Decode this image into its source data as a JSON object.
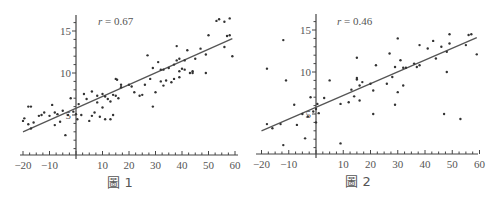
{
  "chart_data": [
    {
      "type": "scatter",
      "title": "",
      "caption": "圖 1",
      "annotation": "r = 0.67",
      "annotation_var": "r",
      "annotation_value": "= 0.67",
      "xlabel": "",
      "ylabel": "",
      "xlim": [
        -21,
        61
      ],
      "ylim": [
        0,
        17
      ],
      "x_ticks": [
        -20,
        -10,
        10,
        20,
        30,
        40,
        50,
        60
      ],
      "x_tick_labels": [
        "−20",
        "−10",
        "10",
        "20",
        "30",
        "40",
        "50",
        "60"
      ],
      "y_ticks": [
        5,
        10,
        15
      ],
      "y_tick_labels": [
        "5",
        "10",
        "15"
      ],
      "grid": false,
      "fit_line": {
        "x": [
          -20,
          59
        ],
        "y": [
          3.0,
          14.1
        ]
      },
      "points": [
        [
          -20,
          4.3
        ],
        [
          -19.5,
          4.6
        ],
        [
          -18,
          6.0
        ],
        [
          -17,
          6.0
        ],
        [
          -18,
          3.9
        ],
        [
          -17,
          3.4
        ],
        [
          -16,
          4.1
        ],
        [
          -14,
          4.9
        ],
        [
          -13,
          5.0
        ],
        [
          -12,
          5.3
        ],
        [
          -10,
          4.9
        ],
        [
          -9,
          6.2
        ],
        [
          -8,
          5.3
        ],
        [
          -8,
          3.8
        ],
        [
          -7,
          5.1
        ],
        [
          -6,
          4.2
        ],
        [
          -5,
          5.5
        ],
        [
          -4,
          2.6
        ],
        [
          -3,
          5.0
        ],
        [
          -2,
          7.0
        ],
        [
          -1,
          5.4
        ],
        [
          0,
          5.1
        ],
        [
          0.5,
          4.5
        ],
        [
          1,
          6.3
        ],
        [
          2,
          5.0
        ],
        [
          3,
          7.5
        ],
        [
          4,
          6.9
        ],
        [
          5,
          4.3
        ],
        [
          6,
          7.8
        ],
        [
          6,
          4.9
        ],
        [
          7,
          5.3
        ],
        [
          8,
          7.3
        ],
        [
          8,
          6.5
        ],
        [
          9,
          4.8
        ],
        [
          10,
          7.5
        ],
        [
          10,
          5.9
        ],
        [
          11,
          7.2
        ],
        [
          11,
          4.5
        ],
        [
          12,
          6.9
        ],
        [
          13,
          4.5
        ],
        [
          13,
          6.6
        ],
        [
          14,
          7.4
        ],
        [
          14,
          5.0
        ],
        [
          15,
          7.3
        ],
        [
          15,
          9.3
        ],
        [
          15.5,
          9.2
        ],
        [
          16,
          7.0
        ],
        [
          17,
          8.6
        ],
        [
          17,
          8.3
        ],
        [
          20,
          8.6
        ],
        [
          21,
          8.4
        ],
        [
          22,
          7.7
        ],
        [
          24,
          7.3
        ],
        [
          25,
          7.4
        ],
        [
          26,
          8.6
        ],
        [
          27,
          12.1
        ],
        [
          28,
          9.3
        ],
        [
          29,
          10.6
        ],
        [
          29,
          6.0
        ],
        [
          30,
          7.7
        ],
        [
          31,
          11.3
        ],
        [
          32,
          10.4
        ],
        [
          32,
          9.0
        ],
        [
          33,
          10.4
        ],
        [
          33,
          8.5
        ],
        [
          34,
          9.1
        ],
        [
          35,
          10.6
        ],
        [
          36,
          8.9
        ],
        [
          37,
          9.3
        ],
        [
          37,
          11.0
        ],
        [
          38,
          11.5
        ],
        [
          38,
          13.2
        ],
        [
          39,
          11.7
        ],
        [
          39,
          10.2
        ],
        [
          39,
          9.5
        ],
        [
          40,
          10.5
        ],
        [
          41,
          11.5
        ],
        [
          41,
          10.4
        ],
        [
          42,
          12.7
        ],
        [
          43,
          10.0
        ],
        [
          44,
          10.2
        ],
        [
          44,
          10.0
        ],
        [
          45,
          11.7
        ],
        [
          47,
          12.9
        ],
        [
          49,
          12.2
        ],
        [
          49,
          10.0
        ],
        [
          50,
          14.5
        ],
        [
          53,
          16.2
        ],
        [
          54,
          16.4
        ],
        [
          56,
          16.1
        ],
        [
          56,
          13.1
        ],
        [
          57,
          14.4
        ],
        [
          58,
          16.5
        ],
        [
          58,
          14.5
        ],
        [
          59,
          12.0
        ]
      ]
    },
    {
      "type": "scatter",
      "title": "",
      "caption": "圖 2",
      "annotation": "r = 0.46",
      "annotation_var": "r",
      "annotation_value": "= 0.46",
      "xlabel": "",
      "ylabel": "",
      "xlim": [
        -21,
        61
      ],
      "ylim": [
        0,
        17
      ],
      "x_ticks": [
        -20,
        -10,
        10,
        20,
        30,
        40,
        50,
        60
      ],
      "x_tick_labels": [
        "−20",
        "−10",
        "10",
        "20",
        "30",
        "40",
        "50",
        "60"
      ],
      "y_ticks": [
        5,
        10,
        15
      ],
      "y_tick_labels": [
        "5",
        "10",
        "15"
      ],
      "grid": false,
      "fit_line": {
        "x": [
          -20,
          59
        ],
        "y": [
          3.0,
          14.1
        ]
      },
      "points": [
        [
          -18,
          10.4
        ],
        [
          -18,
          3.8
        ],
        [
          -16,
          3.3
        ],
        [
          -13,
          3.8
        ],
        [
          -12,
          1.3
        ],
        [
          -12,
          13.8
        ],
        [
          -11,
          9.0
        ],
        [
          -8,
          6.1
        ],
        [
          -7,
          3.7
        ],
        [
          -5,
          5.0
        ],
        [
          -4,
          2.1
        ],
        [
          -3,
          4.7
        ],
        [
          -2,
          7.0
        ],
        [
          -1,
          5.3
        ],
        [
          0,
          5.6
        ],
        [
          0,
          4.0
        ],
        [
          0.5,
          6.2
        ],
        [
          1,
          5.1
        ],
        [
          3,
          6.9
        ],
        [
          5,
          9.0
        ],
        [
          9,
          6.2
        ],
        [
          9,
          1.5
        ],
        [
          12,
          6.4
        ],
        [
          13,
          7.9
        ],
        [
          14,
          7.1
        ],
        [
          15,
          9.3
        ],
        [
          15,
          9.1
        ],
        [
          15,
          11.7
        ],
        [
          16,
          6.6
        ],
        [
          16,
          8.4
        ],
        [
          17,
          8.8
        ],
        [
          20,
          8.6
        ],
        [
          21,
          7.8
        ],
        [
          21,
          5.0
        ],
        [
          22,
          10.8
        ],
        [
          26,
          8.6
        ],
        [
          27,
          12.2
        ],
        [
          28,
          9.4
        ],
        [
          29,
          10.6
        ],
        [
          29,
          6.1
        ],
        [
          30,
          7.6
        ],
        [
          30,
          14.0
        ],
        [
          31,
          11.4
        ],
        [
          32,
          10.5
        ],
        [
          32,
          8.4
        ],
        [
          33,
          10.5
        ],
        [
          36,
          11.0
        ],
        [
          37,
          10.6
        ],
        [
          38,
          10.8
        ],
        [
          38,
          13.2
        ],
        [
          41,
          12.8
        ],
        [
          43,
          13.7
        ],
        [
          44,
          11.6
        ],
        [
          46,
          13.0
        ],
        [
          47,
          5.0
        ],
        [
          48,
          12.4
        ],
        [
          48,
          10.0
        ],
        [
          49,
          14.5
        ],
        [
          49,
          13.4
        ],
        [
          53,
          4.4
        ],
        [
          55,
          13.2
        ],
        [
          56,
          14.4
        ],
        [
          57,
          14.5
        ],
        [
          59,
          12.1
        ]
      ]
    }
  ]
}
